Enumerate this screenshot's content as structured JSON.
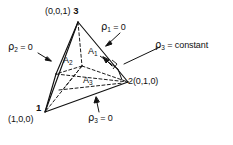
{
  "figure": {
    "type": "tetrahedron-barycentric-diagram",
    "background_color": "#ffffff",
    "line_color": "#111111"
  },
  "vertices": {
    "apex": {
      "number": "3",
      "coords": "(0,0,1)",
      "combined": "(0,0,1) 3"
    },
    "left": {
      "number": "1",
      "coords": "(1,0,0)"
    },
    "right": {
      "number_and_coords": "2(0,1,0)"
    }
  },
  "plane_labels": {
    "rho1_zero": {
      "rho": "ρ",
      "sub": "1",
      "rel": " = 0"
    },
    "rho2_zero": {
      "rho": "ρ",
      "sub": "2",
      "rel": " = 0"
    },
    "rho3_zero": {
      "rho": "ρ",
      "sub": "3",
      "rel": " = 0"
    },
    "rho3_constant": {
      "rho": "ρ",
      "sub": "3",
      "rel": " = constant"
    }
  },
  "area_labels": {
    "a1": {
      "letter": "A",
      "sub": "1"
    },
    "a2": {
      "letter": "A",
      "sub": "2"
    },
    "a3": {
      "letter": "A",
      "sub": "3"
    }
  }
}
